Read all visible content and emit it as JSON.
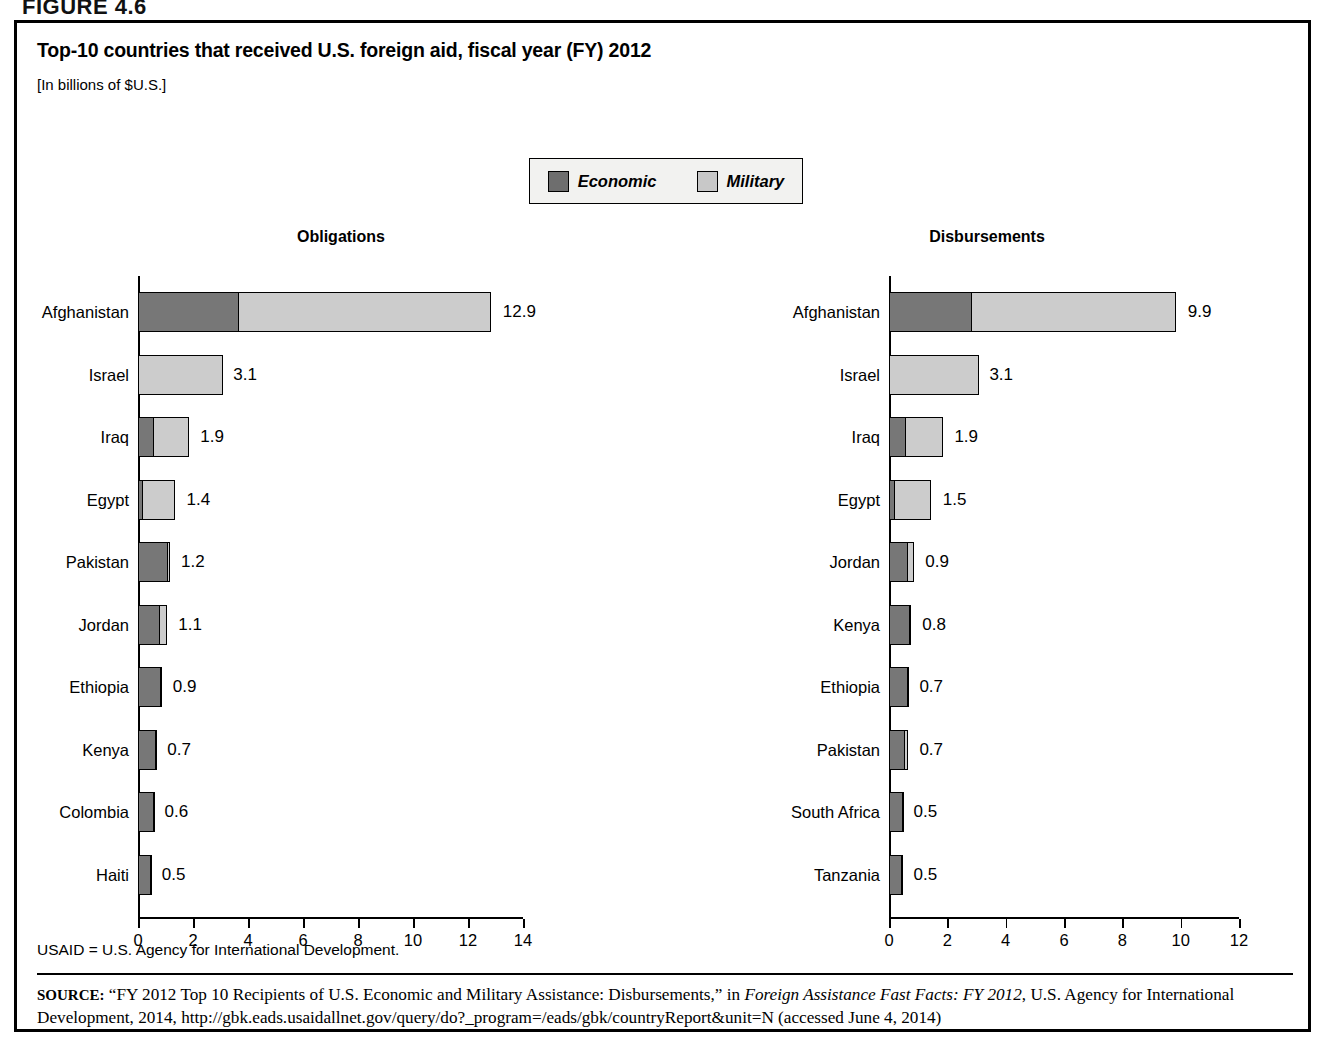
{
  "figure_number": "FIGURE 4.6",
  "title": "Top-10 countries that received U.S. foreign aid, fiscal year (FY) 2012",
  "units": "[In billions of $U.S.]",
  "legend": {
    "economic_label": "Economic",
    "military_label": "Military",
    "economic_color": "#777777",
    "military_color": "#cccccc"
  },
  "footnote": "USAID = U.S. Agency for International Development.",
  "source": {
    "kicker": "SOURCE:",
    "part1": "“FY 2012 Top 10 Recipients of U.S. Economic and Military Assistance: Disbursements,” in ",
    "italic": "Foreign Assistance Fast Facts: FY 2012",
    "part2": ", U.S. Agency for International Development, 2014, http://gbk.eads.usaidallnet.gov/query/do?_program=/eads/gbk/countryReport&unit=N (accessed June 4, 2014)"
  },
  "chart_data": [
    {
      "type": "bar",
      "orientation": "horizontal",
      "stacked": true,
      "title": "Obligations",
      "xlabel": "",
      "ylabel": "",
      "xlim": [
        0,
        14
      ],
      "xticks": [
        0,
        2,
        4,
        6,
        8,
        10,
        12,
        14
      ],
      "grid": false,
      "legend_position": "top-center",
      "categories": [
        "Afghanistan",
        "Israel",
        "Iraq",
        "Egypt",
        "Pakistan",
        "Jordan",
        "Ethiopia",
        "Kenya",
        "Colombia",
        "Haiti"
      ],
      "series": [
        {
          "name": "Economic",
          "values": [
            3.7,
            0.0,
            0.6,
            0.2,
            1.1,
            0.8,
            0.85,
            0.68,
            0.58,
            0.48
          ]
        },
        {
          "name": "Military",
          "values": [
            9.2,
            3.1,
            1.3,
            1.2,
            0.1,
            0.3,
            0.05,
            0.02,
            0.02,
            0.02
          ]
        }
      ],
      "totals": [
        12.9,
        3.1,
        1.9,
        1.4,
        1.2,
        1.1,
        0.9,
        0.7,
        0.6,
        0.5
      ],
      "value_labels": [
        "12.9",
        "3.1",
        "1.9",
        "1.4",
        "1.2",
        "1.1",
        "0.9",
        "0.7",
        "0.6",
        "0.5"
      ]
    },
    {
      "type": "bar",
      "orientation": "horizontal",
      "stacked": true,
      "title": "Disbursements",
      "xlabel": "",
      "ylabel": "",
      "xlim": [
        0,
        12
      ],
      "xticks": [
        0,
        2,
        4,
        6,
        8,
        10,
        12
      ],
      "grid": false,
      "legend_position": "top-center",
      "categories": [
        "Afghanistan",
        "Israel",
        "Iraq",
        "Egypt",
        "Jordan",
        "Kenya",
        "Ethiopia",
        "Pakistan",
        "South Africa",
        "Tanzania"
      ],
      "series": [
        {
          "name": "Economic",
          "values": [
            2.85,
            0.0,
            0.6,
            0.22,
            0.65,
            0.75,
            0.68,
            0.55,
            0.48,
            0.46
          ]
        },
        {
          "name": "Military",
          "values": [
            7.05,
            3.1,
            1.3,
            1.28,
            0.25,
            0.05,
            0.02,
            0.15,
            0.02,
            0.04
          ]
        }
      ],
      "totals": [
        9.9,
        3.1,
        1.9,
        1.5,
        0.9,
        0.8,
        0.7,
        0.7,
        0.5,
        0.5
      ],
      "value_labels": [
        "9.9",
        "3.1",
        "1.9",
        "1.5",
        "0.9",
        "0.8",
        "0.7",
        "0.7",
        "0.5",
        "0.5"
      ]
    }
  ]
}
